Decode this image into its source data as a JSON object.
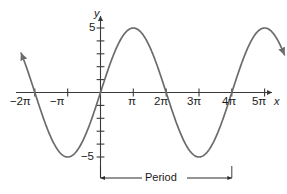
{
  "figure": {
    "title": "",
    "axis_labels": {
      "x": "x",
      "y": "y"
    },
    "annotation": {
      "period_label": "Period"
    },
    "colors": {
      "curve": "#6b6b6b",
      "axis": "#3a3a3a",
      "text": "#1a1a1a",
      "background": "#ffffff"
    }
  },
  "ticks": {
    "x": [
      {
        "label": "−2π",
        "value": -6.2832
      },
      {
        "label": "−π",
        "value": -3.1416
      },
      {
        "label": "π",
        "value": 3.1416
      },
      {
        "label": "2π",
        "value": 6.2832
      },
      {
        "label": "3π",
        "value": 9.4248
      },
      {
        "label": "4π",
        "value": 12.5664
      },
      {
        "label": "5π",
        "value": 15.708
      }
    ],
    "y": [
      {
        "label": "5",
        "value": 5
      },
      {
        "label": "−5",
        "value": -5
      }
    ]
  },
  "chart_data": {
    "type": "line",
    "title": "",
    "xlabel": "x",
    "ylabel": "y",
    "xlim": [
      -7.6,
      17.6
    ],
    "ylim": [
      -6.6,
      6.6
    ],
    "grid": false,
    "legend": null,
    "function": "y = 5 sin(x/2)",
    "amplitude": 5,
    "period": 12.5664,
    "period_label": "Period",
    "period_span": [
      0,
      12.5664
    ],
    "xticks": [
      -6.2832,
      -3.1416,
      3.1416,
      6.2832,
      9.4248,
      12.5664,
      15.708
    ],
    "xtick_labels": [
      "−2π",
      "−π",
      "π",
      "2π",
      "3π",
      "4π",
      "5π"
    ],
    "yticks": [
      5,
      -5
    ],
    "ytick_labels": [
      "5",
      "−5"
    ],
    "minor_yticks": [
      1,
      2,
      3,
      4,
      -1,
      -2,
      -3,
      -4
    ],
    "zero_crossings": [
      -6.2832,
      0,
      6.2832,
      12.5664
    ],
    "maxima": [
      {
        "x": 3.1416,
        "y": 5
      },
      {
        "x": 15.708,
        "y": 5
      }
    ],
    "minima": [
      {
        "x": -3.1416,
        "y": -5
      },
      {
        "x": 9.4248,
        "y": -5
      }
    ],
    "arrow_ends": [
      "left",
      "right"
    ],
    "series": [
      {
        "name": "y = 5 sin(x/2)",
        "x": [
          -7.6,
          -7.2,
          -6.8,
          -6.4,
          -6.0,
          -5.6,
          -5.2,
          -4.8,
          -4.4,
          -4.0,
          -3.6,
          -3.2,
          -2.8,
          -2.4,
          -2.0,
          -1.6,
          -1.2,
          -0.8,
          -0.4,
          0.0,
          0.4,
          0.8,
          1.2,
          1.6,
          2.0,
          2.4,
          2.8,
          3.2,
          3.6,
          4.0,
          4.4,
          4.8,
          5.2,
          5.6,
          6.0,
          6.4,
          6.8,
          7.2,
          7.6,
          8.0,
          8.4,
          8.8,
          9.2,
          9.6,
          10.0,
          10.4,
          10.8,
          11.2,
          11.6,
          12.0,
          12.4,
          12.8,
          13.2,
          13.6,
          14.0,
          14.4,
          14.8,
          15.2,
          15.6,
          16.0,
          16.4,
          16.8,
          17.2,
          17.6
        ],
        "y": [
          3.18,
          2.19,
          1.17,
          0.14,
          -0.89,
          -1.89,
          -2.83,
          -3.68,
          -4.34,
          -4.55,
          -4.94,
          -4.99,
          -4.85,
          -4.52,
          -4.21,
          -3.5,
          -2.82,
          -1.95,
          -0.99,
          0.0,
          0.99,
          1.95,
          2.82,
          3.5,
          4.21,
          4.52,
          4.85,
          4.99,
          4.94,
          4.55,
          4.34,
          3.68,
          2.83,
          1.89,
          0.89,
          -0.14,
          -1.17,
          -2.19,
          -3.15,
          -3.78,
          -4.37,
          -4.75,
          -4.96,
          -4.99,
          -4.79,
          -4.4,
          -3.84,
          -3.13,
          -2.3,
          -1.39,
          -0.45,
          0.52,
          1.46,
          2.36,
          3.16,
          3.85,
          4.4,
          4.76,
          4.96,
          4.98,
          4.82,
          4.5,
          4.02,
          3.4
        ]
      }
    ]
  },
  "geometry": {
    "origin": {
      "x": 100.5,
      "y": 92.5
    },
    "x_unit_px": 10.45,
    "y_unit_px": 12.9
  }
}
